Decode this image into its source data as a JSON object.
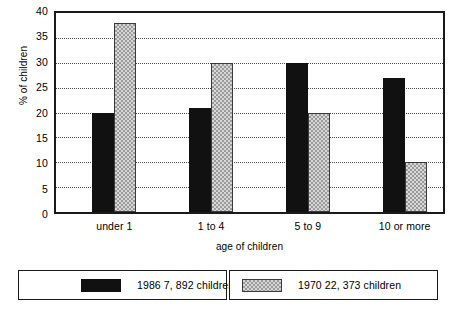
{
  "chart_data": {
    "type": "bar",
    "title": "",
    "subtitle": "",
    "xlabel": "age of children",
    "ylabel": "% of children",
    "categories": [
      "under 1",
      "1 to 4",
      "5 to 9",
      "10 or more"
    ],
    "series": [
      {
        "name": "1986 7, 892 children",
        "values": [
          20,
          21,
          30,
          27
        ],
        "color": "#111111",
        "fill": "solid-black"
      },
      {
        "name": "1970 22, 373 children",
        "values": [
          38,
          30,
          20,
          10
        ],
        "color": "#b8b8b8",
        "fill": "gray-checker"
      }
    ],
    "ylim": [
      0,
      40
    ],
    "ytick_step": 5,
    "ytick_labels": [
      "0",
      "5",
      "10",
      "15",
      "20",
      "25",
      "30",
      "35",
      "40"
    ],
    "grid": "horizontal-dotted",
    "legend_position": "below-chart",
    "annotations": []
  }
}
